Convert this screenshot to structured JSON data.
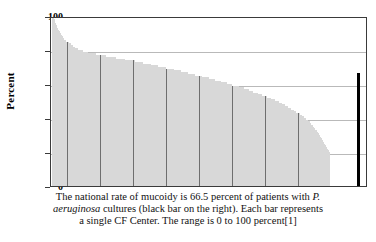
{
  "chart_data": {
    "type": "bar",
    "title": "",
    "subtitle": "",
    "xlabel": "",
    "ylabel": "Percent",
    "ylim": [
      0,
      100
    ],
    "yticks": [
      0,
      20,
      40,
      60,
      80,
      100
    ],
    "ytick_labels": [
      "0",
      "20",
      "40",
      "60",
      "80",
      "100"
    ],
    "grid": true,
    "legend": "none",
    "categories_description": "Individual CF Centers, sorted by percent mucoidy descending",
    "series": [
      {
        "name": "CF Center percent mucoidy",
        "color": "#6e6e6e",
        "values": [
          100,
          100,
          98,
          96,
          95,
          93,
          92,
          91,
          90,
          89,
          88,
          87,
          86,
          86,
          85,
          85,
          84,
          84,
          83,
          83,
          82,
          82,
          81,
          81,
          81,
          80,
          80,
          80,
          80,
          80,
          79,
          79,
          79,
          79,
          79,
          78,
          78,
          78,
          78,
          78,
          78,
          78,
          78,
          77,
          77,
          77,
          77,
          77,
          77,
          77,
          77,
          77,
          76,
          76,
          76,
          76,
          76,
          76,
          76,
          76,
          76,
          76,
          75,
          75,
          75,
          75,
          75,
          75,
          75,
          75,
          75,
          74,
          74,
          74,
          74,
          74,
          74,
          74,
          74,
          74,
          73,
          73,
          73,
          73,
          73,
          73,
          73,
          73,
          72,
          72,
          72,
          72,
          72,
          72,
          72,
          72,
          71,
          71,
          71,
          71,
          71,
          71,
          71,
          70,
          70,
          70,
          70,
          70,
          70,
          70,
          70,
          69,
          69,
          69,
          69,
          69,
          69,
          69,
          68,
          68,
          68,
          68,
          68,
          68,
          68,
          67,
          67,
          67,
          67,
          67,
          67,
          67,
          66,
          66,
          66,
          66,
          66,
          66,
          66,
          65,
          65,
          65,
          65,
          65,
          65,
          64,
          64,
          64,
          64,
          64,
          64,
          64,
          63,
          63,
          63,
          63,
          63,
          63,
          62,
          62,
          62,
          62,
          62,
          62,
          61,
          61,
          61,
          61,
          61,
          61,
          60,
          60,
          60,
          60,
          60,
          59,
          59,
          59,
          59,
          59,
          59,
          58,
          58,
          58,
          58,
          58,
          57,
          57,
          57,
          57,
          57,
          56,
          56,
          56,
          56,
          55,
          55,
          55,
          55,
          55,
          54,
          54,
          54,
          54,
          53,
          53,
          53,
          53,
          52,
          52,
          52,
          52,
          51,
          51,
          51,
          51,
          50,
          50,
          50,
          50,
          49,
          49,
          49,
          48,
          48,
          48,
          47,
          47,
          47,
          46,
          46,
          46,
          45,
          45,
          45,
          44,
          44,
          43,
          43,
          43,
          42,
          42,
          41,
          41,
          40,
          40,
          39,
          39,
          38,
          38,
          37,
          36,
          36,
          35,
          34,
          33,
          33,
          32,
          31,
          30,
          29,
          28,
          27,
          26,
          25,
          24,
          23,
          22,
          21,
          20
        ]
      }
    ],
    "reference_bar": {
      "name": "National rate of mucoidy",
      "value": 66.5,
      "color": "#000000",
      "position": "right"
    },
    "caption_lines": [
      "The national rate of mucoidy is 66.5 percent of patients with P.",
      "aeruginosa cultures (black bar on the right). Each bar represents",
      "a single CF Center.  The range is 0 to 100 percent[1]"
    ]
  },
  "axis": {
    "y_title": "Percent"
  },
  "caption": {
    "line1_a": "The national rate of mucoidy is 66.5 percent of patients with ",
    "line1_italic": "P.",
    "line2_italic": "aeruginosa",
    "line2_b": " cultures (black bar on the right). Each bar represents",
    "line3": "a single CF Center.  The range is 0 to 100 percent[1]"
  }
}
